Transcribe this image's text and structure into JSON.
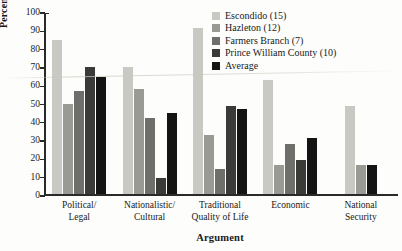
{
  "figure": {
    "top_bleed_text": "",
    "x_title": "Argument",
    "y_title": "Percentage of city officials"
  },
  "legend": {
    "items": [
      {
        "label": "Escondido (15)",
        "color": "#c9c9c4"
      },
      {
        "label": "Hazleton (12)",
        "color": "#9a9a95"
      },
      {
        "label": "Farmers Branch (7)",
        "color": "#6e6e6a"
      },
      {
        "label": "Prince William County (10)",
        "color": "#3a3a38"
      },
      {
        "label": "Average",
        "color": "#141414"
      }
    ]
  },
  "y_axis": {
    "ticks": [
      "100",
      "90",
      "80",
      "70",
      "60",
      "50",
      "40",
      "30",
      "20",
      "10",
      "0"
    ]
  },
  "x_axis": {
    "labels": [
      {
        "line1": "Political/",
        "line2": "Legal"
      },
      {
        "line1": "Nationalistic/",
        "line2": "Cultural"
      },
      {
        "line1": "Traditional",
        "line2": "Quality of Life"
      },
      {
        "line1": "Economic",
        "line2": ""
      },
      {
        "line1": "National",
        "line2": "Security"
      }
    ]
  },
  "chart_data": {
    "type": "bar",
    "title": "",
    "xlabel": "Argument",
    "ylabel": "Percentage of city officials",
    "ylim": [
      0,
      100
    ],
    "ytick_step": 10,
    "grid": false,
    "legend_position": "top-right",
    "categories": [
      "Political/Legal",
      "Nationalistic/Cultural",
      "Traditional Quality of Life",
      "Economic",
      "National Security"
    ],
    "series": [
      {
        "name": "Escondido (15)",
        "color": "#c9c9c4",
        "values": [
          85,
          70,
          92,
          63,
          49
        ]
      },
      {
        "name": "Hazleton (12)",
        "color": "#9a9a95",
        "values": [
          50,
          58,
          33,
          16,
          16
        ]
      },
      {
        "name": "Farmers Branch (7)",
        "color": "#6e6e6a",
        "values": [
          57,
          42,
          14,
          28,
          0
        ]
      },
      {
        "name": "Prince William County (10)",
        "color": "#3a3a38",
        "values": [
          70,
          9,
          49,
          19,
          0
        ]
      },
      {
        "name": "Average",
        "color": "#141414",
        "values": [
          65,
          45,
          47,
          31,
          16
        ]
      }
    ]
  }
}
